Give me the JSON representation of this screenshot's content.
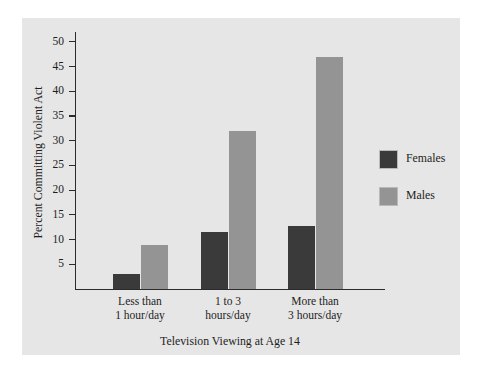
{
  "chart_data": {
    "type": "bar",
    "title": "",
    "xlabel": "Television Viewing at Age 14",
    "ylabel": "Percent Committing Violent Act",
    "categories": [
      "Less than 1 hour/day",
      "1 to 3 hours/day",
      "More than 3 hours/day"
    ],
    "category_lines": [
      [
        "Less than",
        "1 hour/day"
      ],
      [
        "1 to 3",
        "hours/day"
      ],
      [
        "More than",
        "3 hours/day"
      ]
    ],
    "series": [
      {
        "name": "Females",
        "color": "#3a3a3a",
        "values": [
          3,
          11.5,
          12.7
        ]
      },
      {
        "name": "Males",
        "color": "#949494",
        "values": [
          9,
          32,
          47
        ]
      }
    ],
    "ylim": [
      0,
      52
    ],
    "yticks": [
      5,
      10,
      15,
      20,
      25,
      30,
      35,
      40,
      45,
      50
    ],
    "ytick_labels": [
      "5",
      "10",
      "15",
      "20",
      "25",
      "30",
      "35",
      "40",
      "45",
      "50"
    ],
    "grid": false,
    "legend_position": "right",
    "panel_color": "#e6e6e6",
    "axis_color": "#2b2b2b"
  },
  "legend": {
    "entries": [
      {
        "label": "Females"
      },
      {
        "label": "Males"
      }
    ]
  },
  "axes": {
    "x_title": "Television Viewing at Age 14",
    "y_title": "Percent Committing Violent Act"
  }
}
